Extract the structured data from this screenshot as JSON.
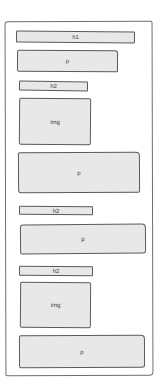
{
  "wireframe": {
    "frame_label": "page",
    "elements": [
      {
        "type": "h1",
        "label": "h1"
      },
      {
        "type": "p",
        "label": "p"
      },
      {
        "type": "h2",
        "label": "h2"
      },
      {
        "type": "img",
        "label": "img"
      },
      {
        "type": "p",
        "label": "p"
      },
      {
        "type": "h2",
        "label": "h2"
      },
      {
        "type": "p",
        "label": "p"
      },
      {
        "type": "h2",
        "label": "h2"
      },
      {
        "type": "img",
        "label": "img"
      },
      {
        "type": "p",
        "label": "p"
      }
    ]
  },
  "colors": {
    "box_fill": "#e8e8e8",
    "stroke": "#5a5a5a",
    "frame_stroke": "#6e6e6e",
    "background": "#ffffff"
  }
}
